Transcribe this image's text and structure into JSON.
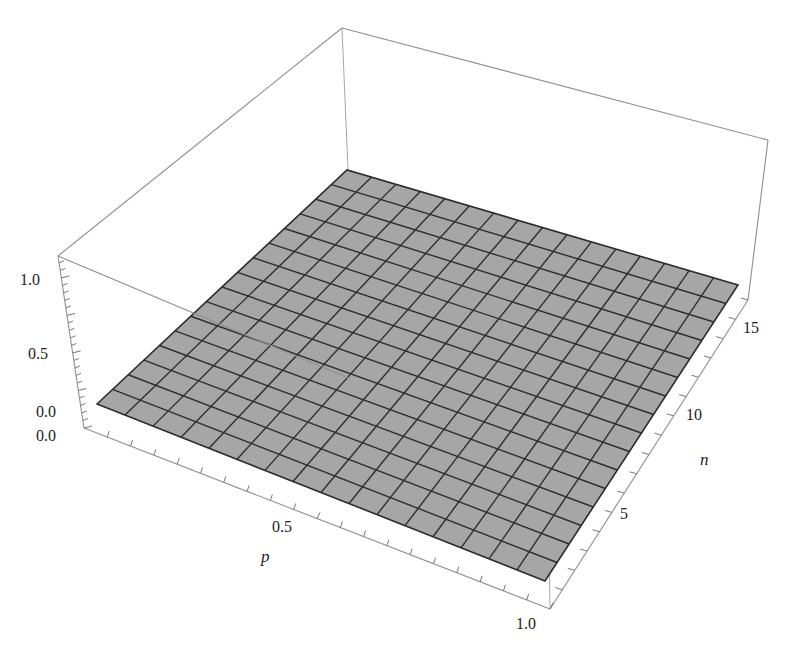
{
  "chart_data": {
    "type": "surface3d",
    "title": "",
    "xlabel": "p",
    "ylabel": "n",
    "zlabel": "",
    "x_range": [
      0.0,
      1.0
    ],
    "y_range": [
      1,
      17
    ],
    "z_range": [
      0.0,
      1.1
    ],
    "x_ticks": [
      "0.0",
      "0.5",
      "1.0"
    ],
    "y_ticks": [
      "5",
      "10",
      "15"
    ],
    "z_ticks": [
      "0.0",
      "0.5",
      "1.0"
    ],
    "grid_cells": {
      "p": 16,
      "n": 16
    },
    "surface_value": 0.1,
    "surface_color": "#a6a6a6",
    "mesh_color": "#2b2b2b",
    "box_color": "#9a9a9a"
  },
  "labels": {
    "z_tick_0": "0.0",
    "z_tick_1": "0.5",
    "z_tick_2": "1.0",
    "p_tick_0": "0.0",
    "p_tick_1": "0.5",
    "p_tick_2": "1.0",
    "n_tick_0": "5",
    "n_tick_1": "10",
    "n_tick_2": "15",
    "p_axis": "p",
    "n_axis": "n"
  }
}
